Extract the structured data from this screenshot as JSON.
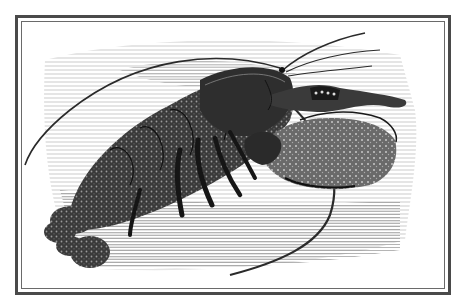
{
  "image": {
    "subject": "Lobster engraving illustration",
    "style": "black-and-white wood engraving",
    "frame": {
      "type": "double-line border",
      "color": "#4a4a4a"
    }
  },
  "colors": {
    "ink": "#1a1a1a",
    "paper": "#ffffff",
    "frame": "#4a4a4a",
    "hatch": "#8a8a8a"
  }
}
